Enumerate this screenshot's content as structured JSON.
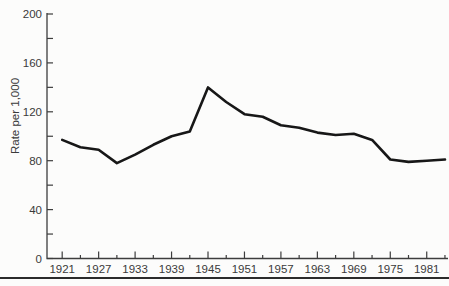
{
  "chart_data": {
    "type": "line",
    "title": "",
    "xlabel": "",
    "ylabel": "Rate per 1,000",
    "x": [
      1921,
      1924,
      1927,
      1930,
      1933,
      1936,
      1939,
      1942,
      1945,
      1948,
      1951,
      1954,
      1957,
      1960,
      1963,
      1966,
      1969,
      1972,
      1975,
      1978,
      1981,
      1984
    ],
    "values": [
      97,
      91,
      89,
      78,
      85,
      93,
      100,
      104,
      140,
      128,
      118,
      116,
      109,
      107,
      103,
      101,
      102,
      97,
      81,
      79,
      80,
      81
    ],
    "x_major_ticks": [
      1921,
      1927,
      1933,
      1939,
      1945,
      1951,
      1957,
      1963,
      1969,
      1975,
      1981
    ],
    "x_minor_ticks": [
      1924,
      1930,
      1936,
      1942,
      1948,
      1954,
      1960,
      1966,
      1972,
      1978,
      1984
    ],
    "y_major_ticks": [
      0,
      40,
      80,
      120,
      160,
      200
    ],
    "y_minor_ticks": [
      20,
      60,
      100,
      140,
      180
    ],
    "xlim": [
      1918.5,
      1984.5
    ],
    "ylim": [
      0,
      200
    ],
    "grid": false,
    "legend": "none",
    "line_color": "#171717",
    "axis_color": "#3d3d3d",
    "text_color": "#3a3a3a"
  }
}
